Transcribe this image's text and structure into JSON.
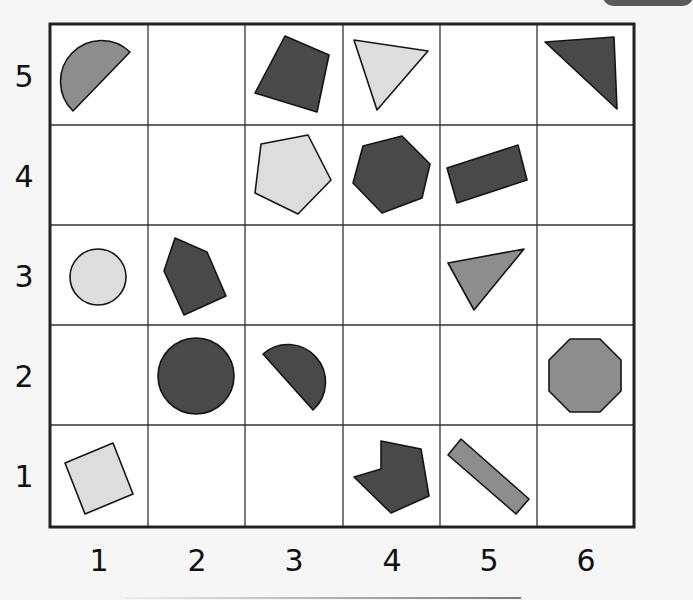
{
  "grid": {
    "columns": 6,
    "rows": 5,
    "x_labels": [
      "1",
      "2",
      "3",
      "4",
      "5",
      "6"
    ],
    "y_labels": [
      "5",
      "4",
      "3",
      "2",
      "1"
    ]
  },
  "colors": {
    "dark": "#494949",
    "medium": "#8d8d8d",
    "light": "#dddddd",
    "stroke": "#151515",
    "cell_bg": "#ffffff",
    "page_bg": "#f6f6f6"
  },
  "shapes": [
    {
      "col": 1,
      "row": 5,
      "type": "semicircle",
      "fill": "medium"
    },
    {
      "col": 3,
      "row": 5,
      "type": "square",
      "fill": "dark"
    },
    {
      "col": 4,
      "row": 5,
      "type": "triangle",
      "fill": "light"
    },
    {
      "col": 6,
      "row": 5,
      "type": "triangle",
      "fill": "dark"
    },
    {
      "col": 3,
      "row": 4,
      "type": "pentagon",
      "fill": "light"
    },
    {
      "col": 4,
      "row": 4,
      "type": "hexagon",
      "fill": "dark"
    },
    {
      "col": 5,
      "row": 4,
      "type": "rectangle",
      "fill": "dark"
    },
    {
      "col": 1,
      "row": 3,
      "type": "circle",
      "fill": "light"
    },
    {
      "col": 2,
      "row": 3,
      "type": "pentagon",
      "fill": "dark"
    },
    {
      "col": 5,
      "row": 3,
      "type": "triangle",
      "fill": "medium"
    },
    {
      "col": 2,
      "row": 2,
      "type": "circle",
      "fill": "dark"
    },
    {
      "col": 3,
      "row": 2,
      "type": "semicircle",
      "fill": "dark"
    },
    {
      "col": 6,
      "row": 2,
      "type": "octagon",
      "fill": "medium"
    },
    {
      "col": 1,
      "row": 1,
      "type": "square",
      "fill": "light"
    },
    {
      "col": 4,
      "row": 1,
      "type": "concave-hexagon",
      "fill": "dark"
    },
    {
      "col": 5,
      "row": 1,
      "type": "rectangle",
      "fill": "medium"
    }
  ]
}
